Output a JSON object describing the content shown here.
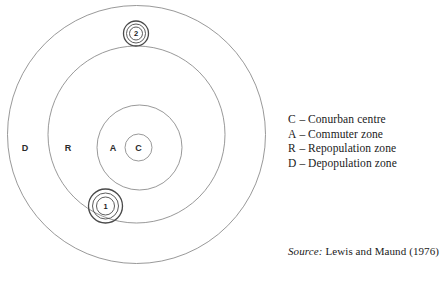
{
  "figure": {
    "type": "concentric-zone-diagram",
    "zones": [
      {
        "key": "C",
        "label": "C",
        "name": "Conurban centre"
      },
      {
        "key": "A",
        "label": "A",
        "name": "Commuter zone"
      },
      {
        "key": "R",
        "label": "R",
        "name": "Repopulation zone"
      },
      {
        "key": "D",
        "label": "D",
        "name": "Depopulation zone"
      }
    ],
    "markers": [
      {
        "label": "1"
      },
      {
        "label": "2"
      }
    ],
    "colors": {
      "ring_stroke": "#8d8d8d",
      "marker_stroke": "#4a4a4a",
      "text": "#1a1a1a",
      "background": "#ffffff"
    }
  },
  "legend": {
    "dash": "–",
    "rows": [
      {
        "key": "C",
        "name": "Conurban centre"
      },
      {
        "key": "A",
        "name": "Commuter zone"
      },
      {
        "key": "R",
        "name": "Repopulation zone"
      },
      {
        "key": "D",
        "name": "Depopulation zone"
      }
    ]
  },
  "source": {
    "label": "Source:",
    "text": "Lewis and Maund (1976)"
  }
}
